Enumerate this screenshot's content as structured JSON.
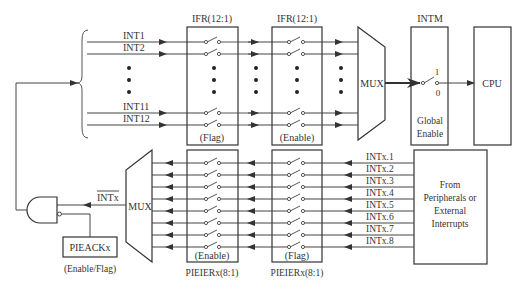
{
  "diagram": {
    "top": {
      "inputs": [
        "INT1",
        "INT2",
        "INT11",
        "INT12"
      ],
      "ifr_flag": {
        "title": "IFR(12:1)",
        "label": "(Flag)"
      },
      "ifr_enable": {
        "title": "IFR(12:1)",
        "label": "(Enable)"
      },
      "mux": "MUX",
      "intm": {
        "title": "INTM",
        "switch_on": "1",
        "switch_off": "0",
        "label_line1": "Global",
        "label_line2": "Enable"
      },
      "cpu": "CPU"
    },
    "bottom": {
      "inputs": [
        "INTx.1",
        "INTx.2",
        "INTx.3",
        "INTx.4",
        "INTx.5",
        "INTx.6",
        "INTx.7",
        "INTx.8"
      ],
      "source": {
        "line1": "From",
        "line2": "Peripherals or",
        "line3": "External",
        "line4": "Interrupts"
      },
      "pieier_flag": {
        "title": "PIEIERx(8:1)",
        "label": "(Flag)"
      },
      "pieier_enable": {
        "title": "PIEIERx(8:1)",
        "label": "(Enable)"
      },
      "mux": "MUX",
      "intx_signal": "INTx",
      "pieack": {
        "label": "PIEACKx",
        "caption": "(Enable/Flag)"
      }
    }
  }
}
